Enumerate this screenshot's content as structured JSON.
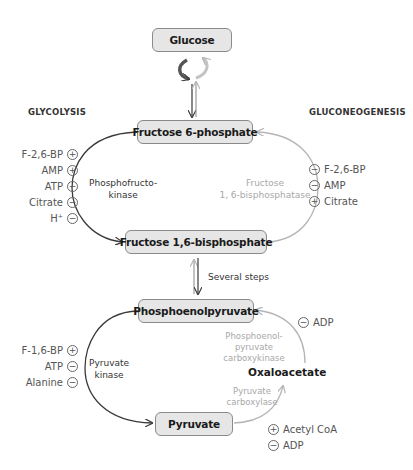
{
  "headings": {
    "glycolysis": "GLYCOLYSIS",
    "gluconeogenesis": "GLUCONEOGENESIS"
  },
  "metabolites": {
    "glucose": "Glucose",
    "f6p": "Fructose 6-phosphate",
    "f16bp": "Fructose 1,6-bisphosphate",
    "pep": "Phosphoenolpyruvate",
    "pyruvate": "Pyruvate",
    "oxaloacetate": "Oxaloacetate"
  },
  "steps": {
    "several_steps": "Several steps"
  },
  "enzymes": {
    "pfk_line1": "Phosphofructo-",
    "pfk_line2": "kinase",
    "fbpase_line1": "Fructose",
    "fbpase_line2": "1, 6-bisphosphatase",
    "pk_line1": "Pyruvate",
    "pk_line2": "kinase",
    "pepck_line1": "Phosphoenol-",
    "pepck_line2": "pyruvate",
    "pepck_line3": "carboxykinase",
    "pc_line1": "Pyruvate",
    "pc_line2": "carboxylase"
  },
  "regulators": {
    "pfk": [
      {
        "name": "F-2,6-BP",
        "sign": "+"
      },
      {
        "name": "AMP",
        "sign": "+"
      },
      {
        "name": "ATP",
        "sign": "−"
      },
      {
        "name": "Citrate",
        "sign": "−"
      },
      {
        "name": "H⁺",
        "sign": "−"
      }
    ],
    "fbpase": [
      {
        "name": "F-2,6-BP",
        "sign": "−"
      },
      {
        "name": "AMP",
        "sign": "−"
      },
      {
        "name": "Citrate",
        "sign": "+"
      }
    ],
    "pk": [
      {
        "name": "F-1,6-BP",
        "sign": "+"
      },
      {
        "name": "ATP",
        "sign": "−"
      },
      {
        "name": "Alanine",
        "sign": "−"
      }
    ],
    "pepck": [
      {
        "name": "ADP",
        "sign": "−"
      }
    ],
    "pc": [
      {
        "name": "Acetyl CoA",
        "sign": "+"
      },
      {
        "name": "ADP",
        "sign": "−"
      }
    ]
  },
  "colors": {
    "glycolysis_arrow": "#3a3a3a",
    "gluconeogenesis_arrow": "#b5b5b5",
    "box_fill": "#e6e6e6",
    "box_border": "#8a8a8a"
  }
}
